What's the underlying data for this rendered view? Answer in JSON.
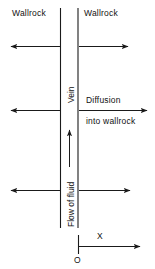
{
  "figure": {
    "type": "geological-schematic"
  },
  "labels": {
    "wallrock_left": "Wallrock",
    "wallrock_right": "Wallrock",
    "vein": "Vein",
    "flow_of_fluid": "Flow of fluid",
    "diffusion": "Diffusion",
    "into_wallrock": "into wallrock",
    "axis_x": "X",
    "origin": "O"
  },
  "arrows": {
    "row1_left": "arrow-left",
    "row1_right": "arrow-right",
    "row2_left": "arrow-left",
    "row2_right": "arrow-right",
    "row3_left": "arrow-left",
    "row3_right": "arrow-right",
    "flow_up": "arrow-up",
    "axis": "arrow-right"
  },
  "colors": {
    "stroke": "#1a1a1a",
    "background": "#ffffff",
    "text": "#111111"
  }
}
